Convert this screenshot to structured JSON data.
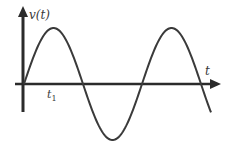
{
  "figure": {
    "y_axis_label": "v(t)",
    "x_axis_label": "t",
    "marker_label": "t",
    "marker_subscript": "1",
    "colors": {
      "axis": "#2b2b2b",
      "curve": "#3a3a3a",
      "background": "#ffffff"
    }
  },
  "chart_data": {
    "type": "line",
    "title": "",
    "xlabel": "t",
    "ylabel": "v(t)",
    "function": "v(t) = A sin(2πt/T)",
    "annotations": [
      {
        "label": "t1",
        "position": "on t-axis, shortly after origin"
      }
    ],
    "key_points_px": [
      {
        "x": 24,
        "y": 84,
        "label": "origin / start"
      },
      {
        "x": 55,
        "y": 28,
        "label": "first peak"
      },
      {
        "x": 82,
        "y": 84,
        "label": "zero crossing"
      },
      {
        "x": 112,
        "y": 140,
        "label": "trough"
      },
      {
        "x": 142,
        "y": 84,
        "label": "zero crossing"
      },
      {
        "x": 172,
        "y": 28,
        "label": "second peak"
      },
      {
        "x": 201,
        "y": 84,
        "label": "zero crossing"
      },
      {
        "x": 211,
        "y": 114,
        "label": "curve end"
      }
    ],
    "grid": false,
    "legend": false
  }
}
